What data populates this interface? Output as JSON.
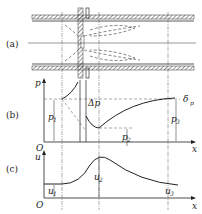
{
  "panels": {
    "a": "(a)",
    "b": "(b)",
    "c": "(c)"
  },
  "panel_b": {
    "y_axis": "p",
    "x_axis": "x",
    "origin": "O",
    "labels": {
      "p1": "p",
      "p1_sub": "1",
      "p2": "p",
      "p2_sub": "2",
      "p3": "p",
      "p3_sub": "3",
      "dp": "Δp",
      "delta": "δ",
      "delta_sub": "p"
    }
  },
  "panel_c": {
    "y_axis": "u",
    "x_axis": "x",
    "origin": "O",
    "labels": {
      "u1": "u",
      "u1_sub": "1",
      "u2": "u",
      "u2_sub": "2",
      "u3": "u",
      "u3_sub": "3"
    }
  }
}
